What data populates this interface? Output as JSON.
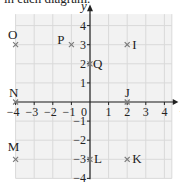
{
  "caption": "in each diagram.",
  "diagram": {
    "x_axis_label": "x",
    "y_axis_label": "y",
    "x_ticks": [
      "−4",
      "−3",
      "−2",
      "−1",
      "0",
      "1",
      "2",
      "3",
      "4"
    ],
    "y_ticks": [
      "4",
      "3",
      "2",
      "1",
      "−1",
      "−2",
      "−3",
      "−4"
    ],
    "origin_label": "0",
    "xlim": [
      -4,
      4
    ],
    "ylim": [
      -4,
      4
    ],
    "points": [
      {
        "name": "O",
        "x": -4,
        "y": 3
      },
      {
        "name": "P",
        "x": -1,
        "y": 3
      },
      {
        "name": "I",
        "x": 2,
        "y": 3
      },
      {
        "name": "Q",
        "x": 0,
        "y": 2
      },
      {
        "name": "N",
        "x": -4,
        "y": 0
      },
      {
        "name": "J",
        "x": 2,
        "y": 0
      },
      {
        "name": "M",
        "x": -4,
        "y": -3
      },
      {
        "name": "L",
        "x": 0,
        "y": -3
      },
      {
        "name": "K",
        "x": 2,
        "y": -3
      }
    ],
    "colors": {
      "grid": "#d9d9d9",
      "grid_bg": "#f2f2f2",
      "axis": "#222222",
      "marker": "#7a7a7a"
    }
  }
}
